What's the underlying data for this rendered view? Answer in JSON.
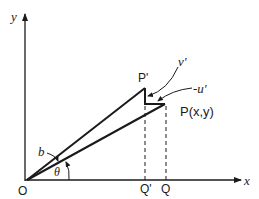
{
  "diagram": {
    "axes": {
      "x_label": "x",
      "y_label": "y",
      "origin_label": "O"
    },
    "points": {
      "p_prime": "P'",
      "p": "P(x,y)",
      "q_prime": "Q'",
      "q": "Q"
    },
    "vectors": {
      "v_prime": "v'",
      "neg_u_prime": "-u'"
    },
    "angles": {
      "b": "b",
      "theta": "θ"
    },
    "colors": {
      "ink": "#1a1a1a",
      "background": "#ffffff"
    }
  }
}
